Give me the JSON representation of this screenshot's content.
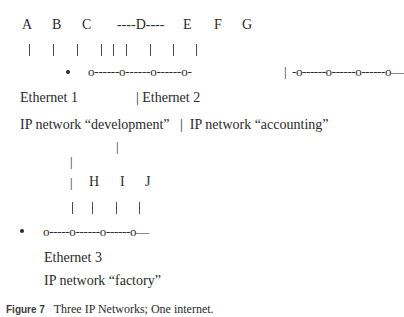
{
  "diagram": {
    "host_labels_row1": {
      "A": "A",
      "B": "B",
      "C": "C",
      "D": "----D----",
      "E": "E",
      "F": "F",
      "G": "G"
    },
    "segment1_wire": "o------o------o------o-",
    "gateway_separator": "|",
    "segment2_wire": "-o------o------o------o—",
    "ethernet1_label": "Ethernet 1",
    "ethernet2_label": "| Ethernet 2",
    "ip_networks_row": "IP network “development”   |  IP network “accounting”",
    "vertical_connector": "|",
    "lower_connector": "|",
    "host_labels_row2": {
      "bar": "|",
      "H": "H",
      "I": "I",
      "J": "J"
    },
    "segment3_wire": "o-----o------o------o—",
    "ethernet3_label": "Ethernet 3",
    "ip_network_factory": "IP network “factory”"
  },
  "caption": {
    "label": "Figure 7",
    "text": "Three IP Networks; One internet."
  }
}
